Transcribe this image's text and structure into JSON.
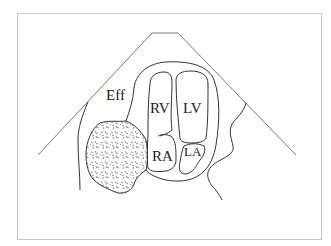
{
  "diagram": {
    "type": "echocardiogram-apical-four-chamber-schematic",
    "labels": {
      "effusion": "Eff",
      "right_ventricle": "RV",
      "left_ventricle": "LV",
      "right_atrium": "RA",
      "left_atrium": "LA"
    },
    "colors": {
      "line": "#333333",
      "frame": "#c8c8c8",
      "background": "#ffffff"
    }
  }
}
